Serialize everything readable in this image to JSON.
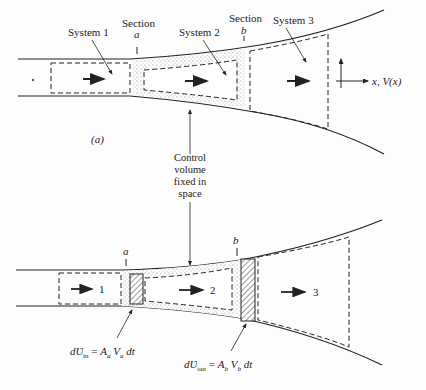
{
  "figure": {
    "panel_a": {
      "label": "(a)",
      "section_a": {
        "word": "Section",
        "letter": "a"
      },
      "section_b": {
        "word": "Section",
        "letter": "b"
      },
      "system1": "System 1",
      "system2": "System 2",
      "system3": "System 3",
      "axis_label": "x, V(x)"
    },
    "control_volume": {
      "line1": "Control",
      "line2": "volume",
      "line3": "fixed in",
      "line4": "space"
    },
    "panel_b": {
      "section_a": "a",
      "section_b": "b",
      "region1": "1",
      "region2": "2",
      "region3": "3",
      "dv_in": {
        "prefix": "d",
        "symbol": "Ʋ",
        "sub": "in",
        "rhs": "= A",
        "rhs_sub1": "a",
        "v": "V",
        "rhs_sub2": "a",
        "dt": "dt"
      },
      "dv_out": {
        "prefix": "d",
        "symbol": "Ʋ",
        "sub": "out",
        "rhs": "= A",
        "rhs_sub1": "b",
        "v": "V",
        "rhs_sub2": "b",
        "dt": "dt"
      }
    },
    "colors": {
      "ink": "#222222",
      "background": "#fdfdfd",
      "stipple": "#999999"
    }
  }
}
